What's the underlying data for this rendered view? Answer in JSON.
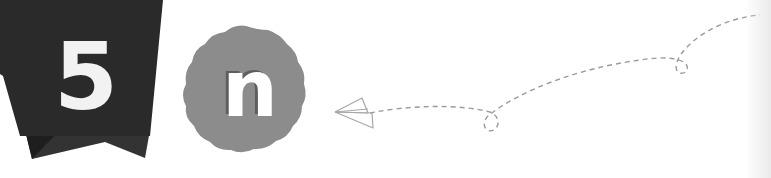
{
  "banner": {
    "number": "5",
    "color": "#2a2a2a",
    "fold_color": "#333333",
    "text_color": "#f2f2f2"
  },
  "badge": {
    "letter": "n",
    "color": "#8c8c8c",
    "text_color": "#ffffff",
    "shadow_color": "#5e5e5e"
  },
  "flight_path": {
    "icon": "paper-plane-icon",
    "stroke_color": "#9a9a9a",
    "loops": 2
  }
}
